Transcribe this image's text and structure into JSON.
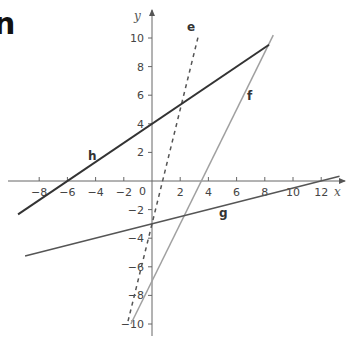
{
  "heading_fragment": "n",
  "chart_data": {
    "type": "line",
    "title": "",
    "xlabel": "x",
    "ylabel": "y",
    "xlim": [
      -9.5,
      13.5
    ],
    "ylim": [
      -11,
      11
    ],
    "grid": false,
    "x_ticks": [
      -8,
      -6,
      -4,
      -2,
      2,
      4,
      6,
      8,
      10,
      12
    ],
    "y_ticks": [
      10,
      8,
      6,
      4,
      2,
      -2,
      -4,
      -6,
      -8,
      -10
    ],
    "origin_label": "0",
    "series": [
      {
        "name": "e",
        "equation": "y = 4x - 3",
        "style": "dashed",
        "color": "#555555",
        "x": [
          -1.7,
          3.3
        ],
        "y": [
          -9.8,
          10.2
        ]
      },
      {
        "name": "f",
        "equation": "y = 2x - 7",
        "style": "solid",
        "color": "#a0a0a0",
        "x": [
          -1.5,
          8.6
        ],
        "y": [
          -10,
          10.2
        ]
      },
      {
        "name": "g",
        "equation": "y = 0.25x - 3",
        "style": "solid",
        "color": "#555555",
        "x": [
          -9,
          13.3
        ],
        "y": [
          -5.25,
          0.33
        ]
      },
      {
        "name": "h",
        "equation": "y = (2/3)x + 4",
        "style": "solid",
        "color": "#333333",
        "x": [
          -9.5,
          8.3
        ],
        "y": [
          -2.33,
          9.53
        ]
      }
    ]
  }
}
